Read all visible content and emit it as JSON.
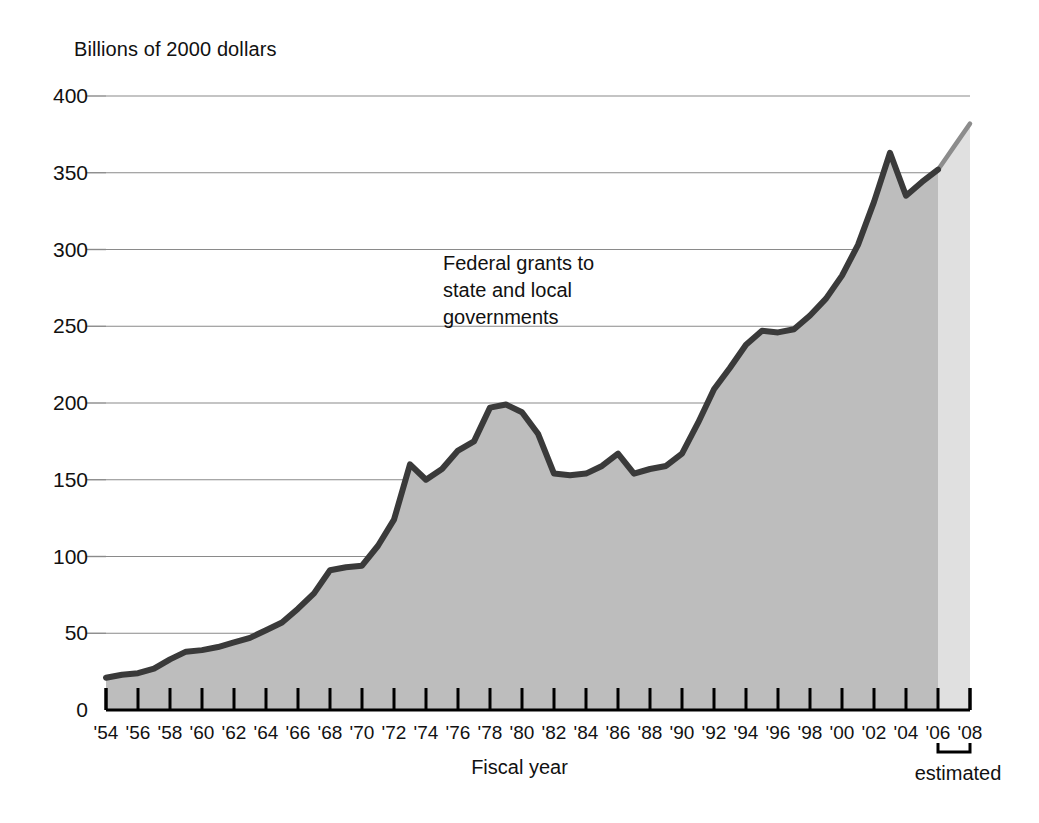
{
  "chart_data": {
    "type": "area",
    "title": "",
    "ylabel": "Billions of 2000 dollars",
    "xlabel": "Fiscal year",
    "ylim": [
      0,
      400
    ],
    "xlim": [
      1954,
      2008
    ],
    "grid": true,
    "legend_position": "none",
    "y_ticks": [
      0,
      50,
      100,
      150,
      200,
      250,
      300,
      350,
      400
    ],
    "y_tick_labels": [
      "0",
      "50",
      "100",
      "150",
      "200",
      "250",
      "300",
      "350",
      "400"
    ],
    "x_ticks": [
      1954,
      1956,
      1958,
      1960,
      1962,
      1964,
      1966,
      1968,
      1970,
      1972,
      1974,
      1976,
      1978,
      1980,
      1982,
      1984,
      1986,
      1988,
      1990,
      1992,
      1994,
      1996,
      1998,
      2000,
      2002,
      2004,
      2006,
      2008
    ],
    "x_tick_labels": [
      "'54",
      "'56",
      "'58",
      "'60",
      "'62",
      "'64",
      "'66",
      "'68",
      "'70",
      "'72",
      "'74",
      "'76",
      "'78",
      "'80",
      "'82",
      "'84",
      "'86",
      "'88",
      "'90",
      "'92",
      "'94",
      "'96",
      "'98",
      "'00",
      "'02",
      "'04",
      "'06",
      "'08"
    ],
    "series": [
      {
        "name": "Federal grants to state and local governments",
        "annotation": "Federal grants to\nstate and local\ngovernments",
        "x": [
          1954,
          1955,
          1956,
          1957,
          1958,
          1959,
          1960,
          1961,
          1962,
          1963,
          1964,
          1965,
          1966,
          1967,
          1968,
          1969,
          1970,
          1971,
          1972,
          1973,
          1974,
          1975,
          1976,
          1977,
          1978,
          1979,
          1980,
          1981,
          1982,
          1983,
          1984,
          1985,
          1986,
          1987,
          1988,
          1989,
          1990,
          1991,
          1992,
          1993,
          1994,
          1995,
          1996,
          1997,
          1998,
          1999,
          2000,
          2001,
          2002,
          2003,
          2004,
          2005,
          2006,
          2007,
          2008
        ],
        "values": [
          21,
          23,
          24,
          27,
          33,
          38,
          39,
          41,
          44,
          47,
          52,
          57,
          66,
          76,
          91,
          93,
          94,
          107,
          124,
          160,
          150,
          157,
          169,
          175,
          197,
          199,
          194,
          180,
          154,
          153,
          154,
          159,
          167,
          154,
          157,
          159,
          167,
          187,
          209,
          223,
          238,
          247,
          246,
          248,
          257,
          268,
          283,
          303,
          331,
          363,
          335,
          344,
          352,
          367,
          382
        ]
      }
    ],
    "estimated_region": {
      "label": "estimated",
      "start_x": 2006,
      "end_x": 2008
    },
    "colors": {
      "actual_fill": "#bdbdbd",
      "estimated_fill": "#e0e0e0",
      "actual_line": "#3a3a3a",
      "estimated_line": "#8c8c8c",
      "gridline": "#8a8a8a",
      "axis": "#000000",
      "text": "#111111"
    }
  }
}
